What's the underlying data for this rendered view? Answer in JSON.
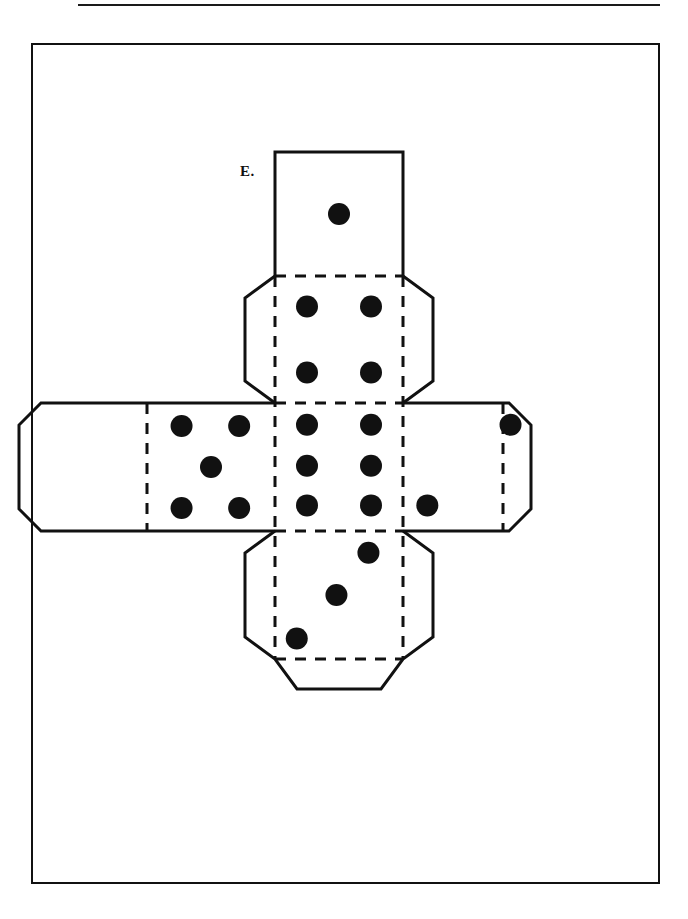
{
  "page": {
    "background_color": "#ffffff",
    "ink_color": "#111111",
    "width": 688,
    "height": 919
  },
  "rule": {
    "name": "top-horizontal-rule",
    "x": 78,
    "y": 4,
    "width": 582,
    "height": 2
  },
  "frame": {
    "name": "page-border",
    "x": 31,
    "y": 43,
    "width": 629,
    "height": 841,
    "stroke": "#111111",
    "stroke_width": 2
  },
  "figure": {
    "label": "E.",
    "label_x": 240,
    "label_y": 163,
    "caption": "",
    "type": "cube-net-dice",
    "geometry": {
      "face_size": 128,
      "tab_depth": 30,
      "tab_inset": 22,
      "dot_radius": 11,
      "solid_stroke": 3,
      "dashed_stroke": 3,
      "dash_pattern": "11 9",
      "center": {
        "x": 275,
        "y": 403
      }
    },
    "faces": [
      {
        "name": "face-top",
        "position": "top",
        "x": 275,
        "y": 152,
        "w": 128,
        "h": 124,
        "pips": 1,
        "pip_layout": "center",
        "pip_positions": [
          [
            0.5,
            0.5
          ]
        ],
        "tabs": []
      },
      {
        "name": "face-upper-middle",
        "position": "upper-middle",
        "x": 275,
        "y": 276,
        "w": 128,
        "h": 127,
        "pips": 4,
        "pip_layout": "four-corners",
        "pip_positions": [
          [
            0.25,
            0.24
          ],
          [
            0.75,
            0.24
          ],
          [
            0.25,
            0.76
          ],
          [
            0.75,
            0.76
          ]
        ],
        "tabs": [
          "left",
          "right"
        ]
      },
      {
        "name": "face-center",
        "position": "center",
        "x": 275,
        "y": 403,
        "w": 128,
        "h": 128,
        "pips": 6,
        "pip_layout": "two-columns-of-three",
        "pip_positions": [
          [
            0.25,
            0.17
          ],
          [
            0.75,
            0.17
          ],
          [
            0.25,
            0.49
          ],
          [
            0.75,
            0.49
          ],
          [
            0.25,
            0.8
          ],
          [
            0.75,
            0.8
          ]
        ],
        "tabs": []
      },
      {
        "name": "face-left",
        "position": "left",
        "x": 147,
        "y": 403,
        "w": 128,
        "h": 128,
        "pips": 5,
        "pip_layout": "four-corners-plus-center",
        "pip_positions": [
          [
            0.27,
            0.18
          ],
          [
            0.72,
            0.18
          ],
          [
            0.5,
            0.5
          ],
          [
            0.27,
            0.82
          ],
          [
            0.72,
            0.82
          ]
        ],
        "tabs": [
          "left",
          "top-chamfer",
          "bottom-chamfer"
        ]
      },
      {
        "name": "face-right",
        "position": "right",
        "x": 403,
        "y": 403,
        "w": 128,
        "h": 128,
        "pips": 2,
        "pip_layout": "diagonal-two",
        "pip_positions": [
          [
            0.84,
            0.17
          ],
          [
            0.19,
            0.8
          ]
        ],
        "tabs": [
          "right"
        ]
      },
      {
        "name": "face-bottom",
        "position": "bottom",
        "x": 275,
        "y": 531,
        "w": 128,
        "h": 128,
        "pips": 3,
        "pip_layout": "diagonal-three",
        "pip_positions": [
          [
            0.73,
            0.17
          ],
          [
            0.48,
            0.5
          ],
          [
            0.17,
            0.84
          ]
        ],
        "tabs": [
          "left",
          "right",
          "bottom"
        ]
      }
    ],
    "fold_lines": {
      "style": "dashed",
      "meaning": "interior fold edges of the cube net"
    },
    "cut_lines": {
      "style": "solid",
      "meaning": "outer cut boundary of the net including glue tabs"
    },
    "total_pips": 21,
    "pip_color": "#111111"
  }
}
